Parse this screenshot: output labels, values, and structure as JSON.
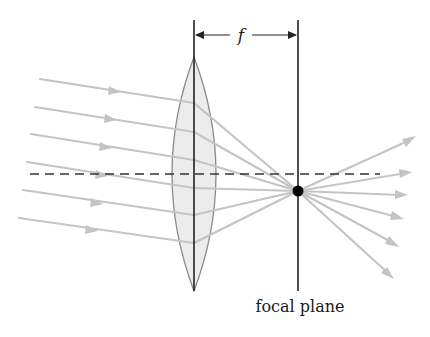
{
  "diagram": {
    "labels": {
      "focal_length": "f",
      "focal_plane": "focal plane"
    },
    "colors": {
      "ray": "#c4c4c4",
      "lens_fill": "#ececec",
      "lens_edge": "#8a8a8a",
      "line": "#222222",
      "focal_point": "#000000"
    },
    "elements": {
      "lens": "biconvex-lens",
      "optical_axis": "dashed horizontal line",
      "focal_point": "black dot at intersection of rays and focal plane",
      "incoming_rays": 6,
      "outgoing_rays": 6
    }
  }
}
